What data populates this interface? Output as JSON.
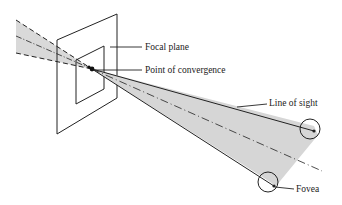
{
  "diagram": {
    "labels": {
      "focal_plane": "Focal plane",
      "point_of_convergence": "Point of convergence",
      "line_of_sight": "Line of sight",
      "fovea": "Fovea"
    },
    "colors": {
      "stroke": "#222222",
      "shade": "#d6d6d6",
      "background": "#ffffff"
    }
  }
}
